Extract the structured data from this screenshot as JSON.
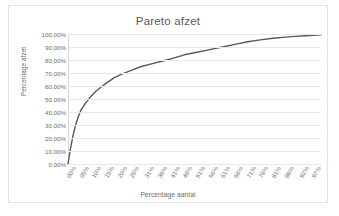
{
  "chart_data": {
    "type": "line",
    "title": "Pareto afzet",
    "xlabel": "Percentage aantal",
    "ylabel": "Percentage afzet",
    "grid": true,
    "legend": "none",
    "xlim": [
      0,
      100
    ],
    "ylim": [
      0,
      100
    ],
    "ytick_labels": [
      "100,00%",
      "90,00%",
      "80,00%",
      "70,00%",
      "60,00%",
      "50,00%",
      "40,00%",
      "30,00%",
      "20,00%",
      "10,00%",
      "0,00%"
    ],
    "ytick_values": [
      100,
      90,
      80,
      70,
      60,
      50,
      40,
      30,
      20,
      10,
      0
    ],
    "xtick_labels": [
      "00%",
      "05%",
      "10%",
      "15%",
      "20%",
      "25%",
      "31%",
      "36%",
      "41%",
      "46%",
      "51%",
      "56%",
      "61%",
      "66%",
      "71%",
      "76%",
      "81%",
      "86%",
      "92%",
      "97%"
    ],
    "xtick_values": [
      0,
      5,
      10,
      15,
      20,
      25,
      31,
      36,
      41,
      46,
      51,
      56,
      61,
      66,
      71,
      76,
      81,
      86,
      92,
      97
    ],
    "series": [
      {
        "name": "Cumulatieve afzet",
        "color": "#595959",
        "x": [
          0,
          1,
          2,
          3,
          4,
          5,
          7,
          9,
          11,
          13,
          15,
          18,
          21,
          25,
          29,
          33,
          37,
          41,
          46,
          51,
          56,
          61,
          66,
          71,
          76,
          81,
          86,
          90,
          94,
          97,
          100
        ],
        "values": [
          0,
          12,
          22,
          30,
          36,
          41,
          47,
          52,
          56,
          59,
          62,
          66,
          69,
          72,
          75,
          77,
          79,
          81,
          84,
          86,
          88,
          90,
          92,
          94,
          95.5,
          96.7,
          97.6,
          98.2,
          98.7,
          99,
          99.3
        ]
      }
    ]
  }
}
